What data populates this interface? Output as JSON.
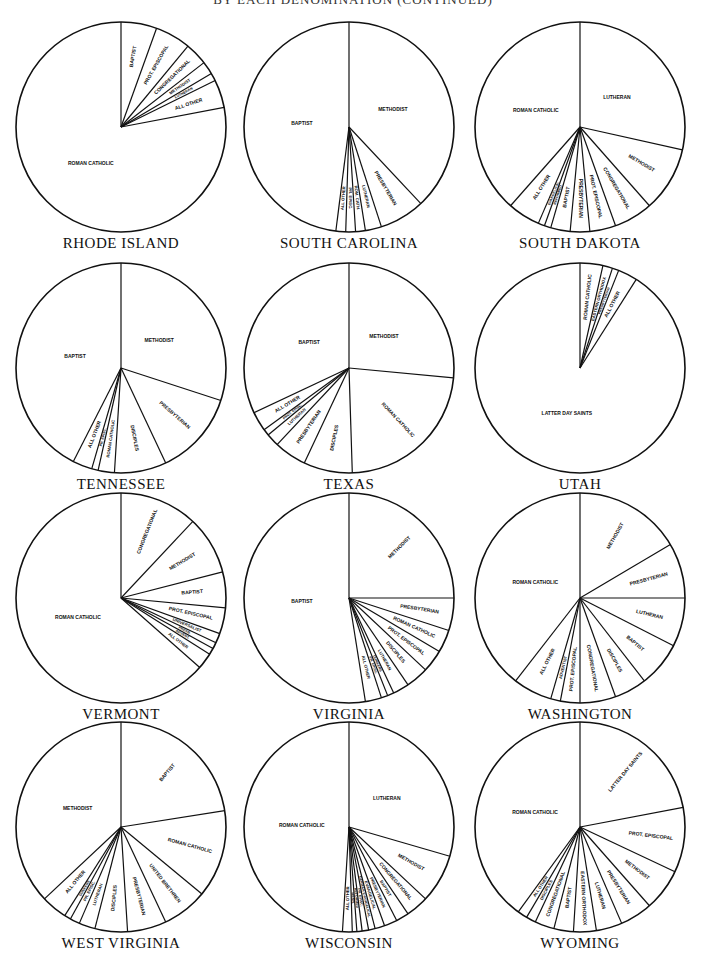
{
  "header": {
    "title": "BY EACH DENOMINATION (CONTINUED)"
  },
  "chart_data": [
    {
      "type": "pie",
      "title": "RHODE ISLAND",
      "cx": 121,
      "cy": 127,
      "r": 105,
      "slices": [
        {
          "label": "BAPTIST",
          "value": 5.5
        },
        {
          "label": "PROT. EPISCOPAL",
          "value": 5.5
        },
        {
          "label": "CONGREGATIONAL",
          "value": 3.5
        },
        {
          "label": "METHODIST",
          "value": 2.0
        },
        {
          "label": "LUTHERAN",
          "value": 1.2
        },
        {
          "label": "ALL OTHER",
          "value": 4.3
        },
        {
          "label": "ROMAN CATHOLIC",
          "value": 78.0
        }
      ]
    },
    {
      "type": "pie",
      "title": "SOUTH CAROLINA",
      "cx": 349,
      "cy": 127,
      "r": 105,
      "slices": [
        {
          "label": "METHODIST",
          "value": 38.0
        },
        {
          "label": "PRESBYTERIAN",
          "value": 7.0
        },
        {
          "label": "LUTHERAN",
          "value": 2.5
        },
        {
          "label": "ROM. CATH.",
          "value": 1.5
        },
        {
          "label": "PR. EPISC.",
          "value": 1.5
        },
        {
          "label": "ALL OTHER",
          "value": 1.5
        },
        {
          "label": "BAPTIST",
          "value": 48.0
        }
      ]
    },
    {
      "type": "pie",
      "title": "SOUTH DAKOTA",
      "cx": 580,
      "cy": 127,
      "r": 105,
      "slices": [
        {
          "label": "LUTHERAN",
          "value": 28.5
        },
        {
          "label": "METHODIST",
          "value": 10.0
        },
        {
          "label": "CONGREGATIONAL",
          "value": 6.0
        },
        {
          "label": "PROT. EPISCOPAL",
          "value": 4.0
        },
        {
          "label": "PRESBYTERIAN",
          "value": 3.0
        },
        {
          "label": "BAPTIST",
          "value": 3.0
        },
        {
          "label": "REFORMED",
          "value": 1.0
        },
        {
          "label": "EVANGELICAL",
          "value": 1.0
        },
        {
          "label": "ALL OTHER",
          "value": 5.0
        },
        {
          "label": "ROMAN CATHOLIC",
          "value": 38.5
        }
      ]
    },
    {
      "type": "pie",
      "title": "TENNESSEE",
      "cx": 121,
      "cy": 368,
      "r": 105,
      "slices": [
        {
          "label": "METHODIST",
          "value": 30.0
        },
        {
          "label": "PRESBYTERIAN",
          "value": 13.0
        },
        {
          "label": "DISCIPLES",
          "value": 8.0
        },
        {
          "label": "ROMAN CATHOLIC",
          "value": 2.5
        },
        {
          "label": "PR. EPISC.",
          "value": 1.0
        },
        {
          "label": "ALL OTHER",
          "value": 3.0
        },
        {
          "label": "BAPTIST",
          "value": 42.5
        }
      ]
    },
    {
      "type": "pie",
      "title": "TEXAS",
      "cx": 349,
      "cy": 368,
      "r": 105,
      "slices": [
        {
          "label": "METHODIST",
          "value": 26.5
        },
        {
          "label": "ROMAN CATHOLIC",
          "value": 23.0
        },
        {
          "label": "DISCIPLES",
          "value": 7.5
        },
        {
          "label": "PRESBYTERIAN",
          "value": 5.0
        },
        {
          "label": "LUTHERAN",
          "value": 2.0
        },
        {
          "label": "PROT. EPISC.",
          "value": 1.0
        },
        {
          "label": "ALL OTHER",
          "value": 3.0
        },
        {
          "label": "BAPTIST",
          "value": 32.0
        }
      ]
    },
    {
      "type": "pie",
      "title": "UTAH",
      "cx": 580,
      "cy": 368,
      "r": 105,
      "slices": [
        {
          "label": "ROMAN CATHOLIC",
          "value": 3.5
        },
        {
          "label": "EASTERN ORTHODOX",
          "value": 1.5
        },
        {
          "label": "PRESBYTERIAN",
          "value": 1.0
        },
        {
          "label": "ALL OTHER",
          "value": 3.0
        },
        {
          "label": "LATTER DAY SAINTS",
          "value": 91.0
        }
      ]
    },
    {
      "type": "pie",
      "title": "VERMONT",
      "cx": 121,
      "cy": 598,
      "r": 105,
      "slices": [
        {
          "label": "CONGREGATIONAL",
          "value": 12.0
        },
        {
          "label": "METHODIST",
          "value": 9.0
        },
        {
          "label": "BAPTIST",
          "value": 5.5
        },
        {
          "label": "PROT. EPISCOPAL",
          "value": 4.0
        },
        {
          "label": "UNIVERSALIST",
          "value": 1.5
        },
        {
          "label": "PRESB.",
          "value": 1.0
        },
        {
          "label": "ADVENT.",
          "value": 1.0
        },
        {
          "label": "ALL OTHER",
          "value": 2.5
        },
        {
          "label": "ROMAN CATHOLIC",
          "value": 63.5
        }
      ]
    },
    {
      "type": "pie",
      "title": "VIRGINIA",
      "cx": 349,
      "cy": 598,
      "r": 105,
      "slices": [
        {
          "label": "METHODIST",
          "value": 25.0
        },
        {
          "label": "PRESBYTERIAN",
          "value": 5.0
        },
        {
          "label": "ROMAN CATHOLIC",
          "value": 3.5
        },
        {
          "label": "PROT. EPISCOPAL",
          "value": 3.5
        },
        {
          "label": "DISCIPLES",
          "value": 3.5
        },
        {
          "label": "LUTHERAN",
          "value": 2.5
        },
        {
          "label": "DUNKERS",
          "value": 1.0
        },
        {
          "label": "PR. EPISC.",
          "value": 1.0
        },
        {
          "label": "ALL OTHER",
          "value": 2.5
        },
        {
          "label": "BAPTIST",
          "value": 52.5
        }
      ]
    },
    {
      "type": "pie",
      "title": "WASHINGTON",
      "cx": 580,
      "cy": 598,
      "r": 105,
      "slices": [
        {
          "label": "METHODIST",
          "value": 16.5
        },
        {
          "label": "PRESBYTERIAN",
          "value": 8.5
        },
        {
          "label": "LUTHERAN",
          "value": 7.5
        },
        {
          "label": "BAPTIST",
          "value": 7.0
        },
        {
          "label": "DISCIPLES",
          "value": 5.0
        },
        {
          "label": "CONGREGATIONAL",
          "value": 5.5
        },
        {
          "label": "PROT. EPISCOPAL",
          "value": 3.0
        },
        {
          "label": "ADVENTIST",
          "value": 1.5
        },
        {
          "label": "ALL OTHER",
          "value": 6.0
        },
        {
          "label": "ROMAN CATHOLIC",
          "value": 39.5
        }
      ]
    },
    {
      "type": "pie",
      "title": "WEST VIRGINIA",
      "cx": 121,
      "cy": 827,
      "r": 105,
      "slices": [
        {
          "label": "BAPTIST",
          "value": 22.5
        },
        {
          "label": "ROMAN CATHOLIC",
          "value": 13.5
        },
        {
          "label": "UNITED BRETHREN",
          "value": 7.0
        },
        {
          "label": "PRESBYTERIAN",
          "value": 6.0
        },
        {
          "label": "DISCIPLES",
          "value": 5.0
        },
        {
          "label": "LUTHERAN",
          "value": 2.5
        },
        {
          "label": "PR. EPISC.",
          "value": 1.5
        },
        {
          "label": "DUNKERS",
          "value": 1.0
        },
        {
          "label": "ALL OTHER",
          "value": 4.0
        },
        {
          "label": "METHODIST",
          "value": 37.0
        }
      ]
    },
    {
      "type": "pie",
      "title": "WISCONSIN",
      "cx": 349,
      "cy": 827,
      "r": 105,
      "slices": [
        {
          "label": "LUTHERAN",
          "value": 29.5
        },
        {
          "label": "METHODIST",
          "value": 7.5
        },
        {
          "label": "CONGREGATIONAL",
          "value": 3.5
        },
        {
          "label": "BAPTIST",
          "value": 2.0
        },
        {
          "label": "PRESBYTERIAN",
          "value": 2.0
        },
        {
          "label": "EVANGELICAL",
          "value": 1.5
        },
        {
          "label": "GERMAN EVANGELICAL",
          "value": 1.0
        },
        {
          "label": "PR. EPISC.",
          "value": 1.0
        },
        {
          "label": "REFORMED",
          "value": 0.8
        },
        {
          "label": "MENN.",
          "value": 0.7
        },
        {
          "label": "ALL OTHER",
          "value": 1.5
        },
        {
          "label": "ROMAN CATHOLIC",
          "value": 49.0
        }
      ]
    },
    {
      "type": "pie",
      "title": "WYOMING",
      "cx": 580,
      "cy": 827,
      "r": 105,
      "slices": [
        {
          "label": "LATTER DAY SAINTS",
          "value": 22.0
        },
        {
          "label": "PROT. EPISCOPAL",
          "value": 10.0
        },
        {
          "label": "METHODIST",
          "value": 6.5
        },
        {
          "label": "PRESBYTERIAN",
          "value": 5.0
        },
        {
          "label": "LUTHERAN",
          "value": 4.0
        },
        {
          "label": "EASTERN ORTHODOX",
          "value": 3.5
        },
        {
          "label": "BAPTIST",
          "value": 3.0
        },
        {
          "label": "CONGREGATIONAL",
          "value": 3.0
        },
        {
          "label": "DISCIPLES",
          "value": 1.5
        },
        {
          "label": "ALL OTHER",
          "value": 1.5
        },
        {
          "label": "ROMAN CATHOLIC",
          "value": 40.0
        }
      ]
    }
  ]
}
